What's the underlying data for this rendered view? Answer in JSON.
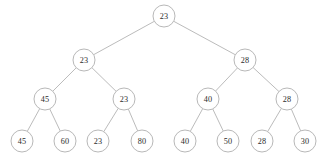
{
  "figure": {
    "background_color": "#ffffff",
    "node_stroke_color": "#b0b0b0",
    "node_fill_color": "#ffffff",
    "edge_color": "#a9a9a9",
    "label_color": "#2b2b2b",
    "node_radius": 11
  },
  "tree": {
    "levels": [
      {
        "level": 1,
        "name": "root",
        "nodes": [
          {
            "id": "n0",
            "label": "23",
            "x": 164,
            "y": 16
          }
        ]
      },
      {
        "level": 2,
        "name": "internal",
        "nodes": [
          {
            "id": "n1",
            "label": "23",
            "x": 84,
            "y": 60
          },
          {
            "id": "n2",
            "label": "28",
            "x": 245,
            "y": 60
          }
        ]
      },
      {
        "level": 3,
        "name": "internal",
        "nodes": [
          {
            "id": "n3",
            "label": "45",
            "x": 45,
            "y": 99
          },
          {
            "id": "n4",
            "label": "23",
            "x": 124,
            "y": 99
          },
          {
            "id": "n5",
            "label": "40",
            "x": 208,
            "y": 99
          },
          {
            "id": "n6",
            "label": "28",
            "x": 287,
            "y": 99
          }
        ]
      },
      {
        "level": 4,
        "name": "leaves",
        "nodes": [
          {
            "id": "n7",
            "label": "45",
            "x": 22,
            "y": 141
          },
          {
            "id": "n8",
            "label": "60",
            "x": 65,
            "y": 141
          },
          {
            "id": "n9",
            "label": "23",
            "x": 98,
            "y": 141
          },
          {
            "id": "n10",
            "label": "80",
            "x": 142,
            "y": 141
          },
          {
            "id": "n11",
            "label": "40",
            "x": 185,
            "y": 141
          },
          {
            "id": "n12",
            "label": "50",
            "x": 228,
            "y": 141
          },
          {
            "id": "n13",
            "label": "28",
            "x": 262,
            "y": 141
          },
          {
            "id": "n14",
            "label": "30",
            "x": 305,
            "y": 141
          }
        ]
      }
    ],
    "edges": [
      {
        "from": "n0",
        "to": "n1"
      },
      {
        "from": "n0",
        "to": "n2"
      },
      {
        "from": "n1",
        "to": "n3"
      },
      {
        "from": "n1",
        "to": "n4"
      },
      {
        "from": "n2",
        "to": "n5"
      },
      {
        "from": "n2",
        "to": "n6"
      },
      {
        "from": "n3",
        "to": "n7"
      },
      {
        "from": "n3",
        "to": "n8"
      },
      {
        "from": "n4",
        "to": "n9"
      },
      {
        "from": "n4",
        "to": "n10"
      },
      {
        "from": "n5",
        "to": "n11"
      },
      {
        "from": "n5",
        "to": "n12"
      },
      {
        "from": "n6",
        "to": "n13"
      },
      {
        "from": "n6",
        "to": "n14"
      }
    ]
  }
}
